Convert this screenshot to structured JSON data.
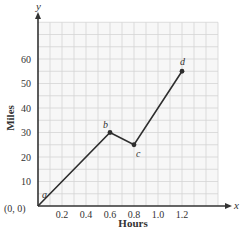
{
  "chart_data": {
    "type": "line",
    "title": "",
    "xlabel": "Hours",
    "ylabel": "Miles",
    "x_axis_var": "x",
    "y_axis_var": "y",
    "origin_label": "(0, 0)",
    "xlim": [
      0,
      1.5
    ],
    "ylim": [
      0,
      75
    ],
    "x_ticks": [
      0.2,
      0.4,
      0.6,
      0.8,
      1.0,
      1.2
    ],
    "x_tick_labels": [
      "0.2",
      "0.4",
      "0.6",
      "0.8",
      "1.0",
      "1.2"
    ],
    "y_ticks": [
      10,
      20,
      30,
      40,
      50,
      60
    ],
    "y_tick_labels": [
      "10",
      "20",
      "30",
      "40",
      "50",
      "60"
    ],
    "grid": true,
    "grid_minor_x": 0.1,
    "grid_minor_y": 5,
    "legend": null,
    "series": [
      {
        "name": "trip",
        "points": [
          {
            "label": "a",
            "x": 0,
            "y": 0
          },
          {
            "label": "b",
            "x": 0.6,
            "y": 30
          },
          {
            "label": "c",
            "x": 0.8,
            "y": 25
          },
          {
            "label": "d",
            "x": 1.2,
            "y": 55
          }
        ]
      }
    ],
    "colors": {
      "line": "#2e2e2e",
      "grid": "#d4d4d4",
      "grid_bg": "#f7f7f7",
      "axis": "#333333"
    }
  }
}
